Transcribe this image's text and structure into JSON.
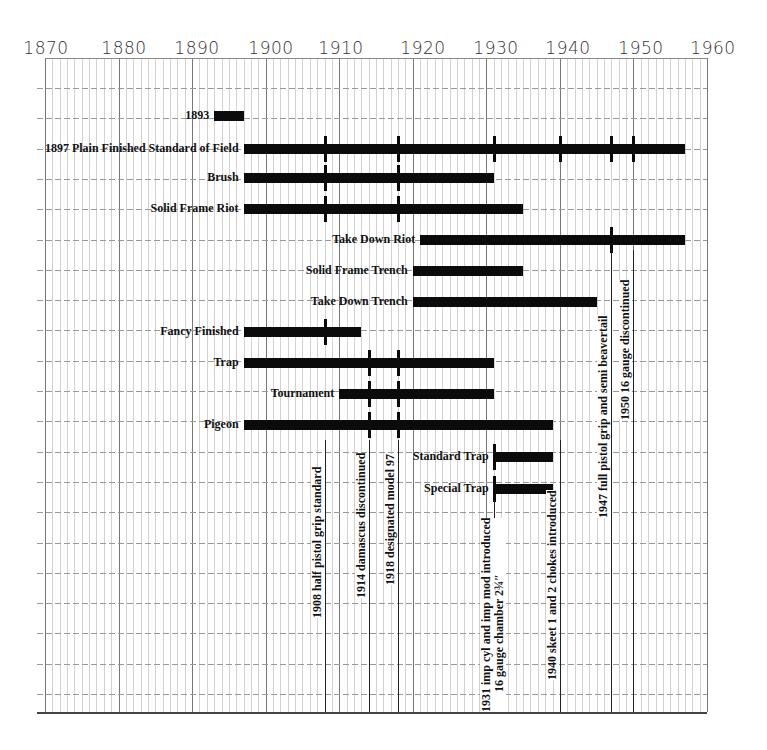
{
  "chart_data": {
    "type": "timeline",
    "title": "",
    "xlabel": "",
    "ylabel": "",
    "xlim": [
      1870,
      1960
    ],
    "x_ticks": [
      "1870",
      "1880",
      "1890",
      "1900",
      "1910",
      "1920",
      "1930",
      "1940",
      "1950",
      "1960"
    ],
    "grid": true,
    "series": [
      {
        "name": "1893",
        "start": 1893,
        "end": 1897,
        "markers": []
      },
      {
        "name": "1897 Plain Finished Standard of Field",
        "start": 1897,
        "end": 1957,
        "markers": [
          1908,
          1918,
          1931,
          1940,
          1947,
          1950
        ]
      },
      {
        "name": "Brush",
        "start": 1897,
        "end": 1931,
        "markers": [
          1908,
          1918
        ]
      },
      {
        "name": "Solid Frame Riot",
        "start": 1897,
        "end": 1935,
        "markers": [
          1908,
          1918
        ]
      },
      {
        "name": "Take Down Riot",
        "start": 1921,
        "end": 1957,
        "markers": [
          1947
        ]
      },
      {
        "name": "Solid Frame Trench",
        "start": 1920,
        "end": 1935,
        "markers": []
      },
      {
        "name": "Take Down Trench",
        "start": 1920,
        "end": 1945,
        "markers": []
      },
      {
        "name": "Fancy Finished",
        "start": 1897,
        "end": 1913,
        "markers": [
          1908
        ]
      },
      {
        "name": "Trap",
        "start": 1897,
        "end": 1931,
        "markers": [
          1914,
          1918
        ]
      },
      {
        "name": "Tournament",
        "start": 1910,
        "end": 1931,
        "markers": [
          1914,
          1918
        ]
      },
      {
        "name": "Pigeon",
        "start": 1897,
        "end": 1939,
        "markers": [
          1914,
          1918
        ]
      },
      {
        "name": "Standard Trap",
        "start": 1931,
        "end": 1939,
        "markers": [
          1931
        ]
      },
      {
        "name": "Special Trap",
        "start": 1931,
        "end": 1939,
        "markers": [
          1931
        ]
      }
    ],
    "annotations": [
      {
        "year": 1908,
        "text": "1908 half pistol grip standard"
      },
      {
        "year": 1914,
        "text": "1914 damascus discontinued"
      },
      {
        "year": 1918,
        "text": "1918 designated model 97"
      },
      {
        "year": 1931,
        "text": "1931 imp cyl and imp mod introduced",
        "text2": "16 gauge chamber 2¾″"
      },
      {
        "year": 1940,
        "text": "1940 skeet 1 and 2 chokes introduced"
      },
      {
        "year": 1947,
        "text": "1947 full pistol grip and semi beavertail"
      },
      {
        "year": 1950,
        "text": "1950 16 gauge discontinued"
      }
    ]
  },
  "axis": {
    "labels": [
      "1870",
      "1880",
      "1890",
      "1900",
      "1910",
      "1920",
      "1930",
      "1940",
      "1950",
      "1960"
    ]
  },
  "bars": [
    {
      "label": "1893"
    },
    {
      "label": "1897 Plain Finished Standard of Field"
    },
    {
      "label": "Brush"
    },
    {
      "label": "Solid Frame Riot"
    },
    {
      "label": "Take Down Riot"
    },
    {
      "label": "Solid Frame Trench"
    },
    {
      "label": "Take Down Trench"
    },
    {
      "label": "Fancy Finished"
    },
    {
      "label": "Trap"
    },
    {
      "label": "Tournament"
    },
    {
      "label": "Pigeon"
    },
    {
      "label": "Standard Trap"
    },
    {
      "label": "Special Trap"
    }
  ],
  "events": [
    {
      "text": "1908 half pistol grip standard"
    },
    {
      "text": "1914 damascus discontinued"
    },
    {
      "text": "1918 designated model 97"
    },
    {
      "text": "1931 imp cyl and imp mod introduced",
      "text2": "16 gauge chamber 2¾″"
    },
    {
      "text": "1940 skeet 1 and 2 chokes introduced"
    },
    {
      "text": "1947 full pistol grip and semi beavertail"
    },
    {
      "text": "1950 16 gauge discontinued"
    }
  ]
}
